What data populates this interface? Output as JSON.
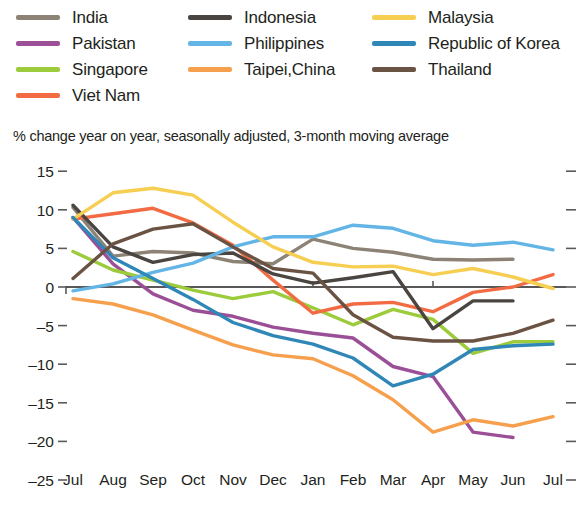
{
  "legend": {
    "columns": [
      [
        {
          "label": "India",
          "color": "#8c8376"
        },
        {
          "label": "Pakistan",
          "color": "#9b4f96"
        },
        {
          "label": "Singapore",
          "color": "#9ccb3b"
        },
        {
          "label": "Viet Nam",
          "color": "#f26b43"
        }
      ],
      [
        {
          "label": "Indonesia",
          "color": "#4a4540"
        },
        {
          "label": "Philippines",
          "color": "#62b5e5"
        },
        {
          "label": "Taipei,China",
          "color": "#f6a04d"
        }
      ],
      [
        {
          "label": "Malaysia",
          "color": "#f6ce52"
        },
        {
          "label": "Republic of Korea",
          "color": "#2f87b7"
        },
        {
          "label": "Thailand",
          "color": "#6b5344"
        }
      ]
    ]
  },
  "chart_data": {
    "type": "line",
    "title": "",
    "subtitle": "",
    "ylabel": "% change year on year, seasonally adjusted, 3-month moving average",
    "xlabel": "",
    "ylim": [
      -25,
      15
    ],
    "yticks": [
      15,
      10,
      5,
      0,
      -5,
      -10,
      -15,
      -20,
      -25
    ],
    "ytick_labels": [
      "15",
      "10",
      "5",
      "0",
      "–5",
      "–10",
      "–15",
      "–20",
      "–25"
    ],
    "grid": false,
    "legend_position": "top",
    "x": [
      "Jul",
      "Aug",
      "Sep",
      "Oct",
      "Nov",
      "Dec",
      "Jan",
      "Feb",
      "Mar",
      "Apr",
      "May",
      "Jun",
      "Jul"
    ],
    "x_year_groups": [
      {
        "label": "2022",
        "at_index": 0
      },
      {
        "label": "2023",
        "at_index": 6
      }
    ],
    "series": [
      {
        "name": "India",
        "color": "#8c8376",
        "values": [
          10.3,
          4.0,
          4.6,
          4.4,
          3.3,
          3.0,
          6.2,
          5.0,
          4.5,
          3.6,
          3.5,
          3.6,
          null
        ]
      },
      {
        "name": "Pakistan",
        "color": "#9b4f96",
        "values": [
          9.0,
          3.0,
          -0.9,
          -3.0,
          -3.8,
          -5.2,
          -6.0,
          -6.6,
          -10.3,
          -11.6,
          -18.8,
          -19.5,
          null
        ]
      },
      {
        "name": "Singapore",
        "color": "#9ccb3b",
        "values": [
          4.6,
          2.2,
          0.9,
          -0.4,
          -1.5,
          -0.6,
          -2.7,
          -4.9,
          -2.9,
          -4.2,
          -8.6,
          -7.1,
          -7.1
        ]
      },
      {
        "name": "Viet Nam",
        "color": "#f26b43",
        "values": [
          8.8,
          9.5,
          10.2,
          8.3,
          5.4,
          0.9,
          -3.4,
          -2.2,
          -2.0,
          -3.2,
          -0.7,
          0.0,
          1.6
        ]
      },
      {
        "name": "Indonesia",
        "color": "#4a4540",
        "values": [
          10.6,
          5.2,
          3.2,
          4.2,
          4.4,
          1.7,
          0.5,
          1.2,
          2.0,
          -5.4,
          -1.8,
          -1.8,
          null
        ]
      },
      {
        "name": "Philippines",
        "color": "#62b5e5",
        "values": [
          -0.5,
          0.4,
          1.9,
          3.1,
          5.2,
          6.5,
          6.5,
          8.0,
          7.6,
          6.0,
          5.4,
          5.8,
          4.8
        ]
      },
      {
        "name": "Taipei,China",
        "color": "#f6a04d",
        "values": [
          -1.5,
          -2.2,
          -3.6,
          -5.6,
          -7.5,
          -8.8,
          -9.3,
          -11.5,
          -14.6,
          -18.8,
          -17.2,
          -18.0,
          -16.8
        ]
      },
      {
        "name": "Malaysia",
        "color": "#f6ce52",
        "values": [
          8.8,
          12.2,
          12.8,
          11.9,
          8.4,
          5.2,
          3.2,
          2.6,
          2.7,
          1.6,
          2.4,
          1.3,
          -0.2
        ]
      },
      {
        "name": "Republic of Korea",
        "color": "#2f87b7",
        "values": [
          9.0,
          3.8,
          1.1,
          -1.6,
          -4.6,
          -6.3,
          -7.4,
          -9.2,
          -12.8,
          -11.3,
          -8.1,
          -7.6,
          -7.4
        ]
      },
      {
        "name": "Thailand",
        "color": "#6b5344",
        "values": [
          1.1,
          5.6,
          7.5,
          8.2,
          5.2,
          2.4,
          1.8,
          -3.6,
          -6.5,
          -7.0,
          -7.0,
          -6.0,
          -4.3
        ]
      }
    ]
  }
}
